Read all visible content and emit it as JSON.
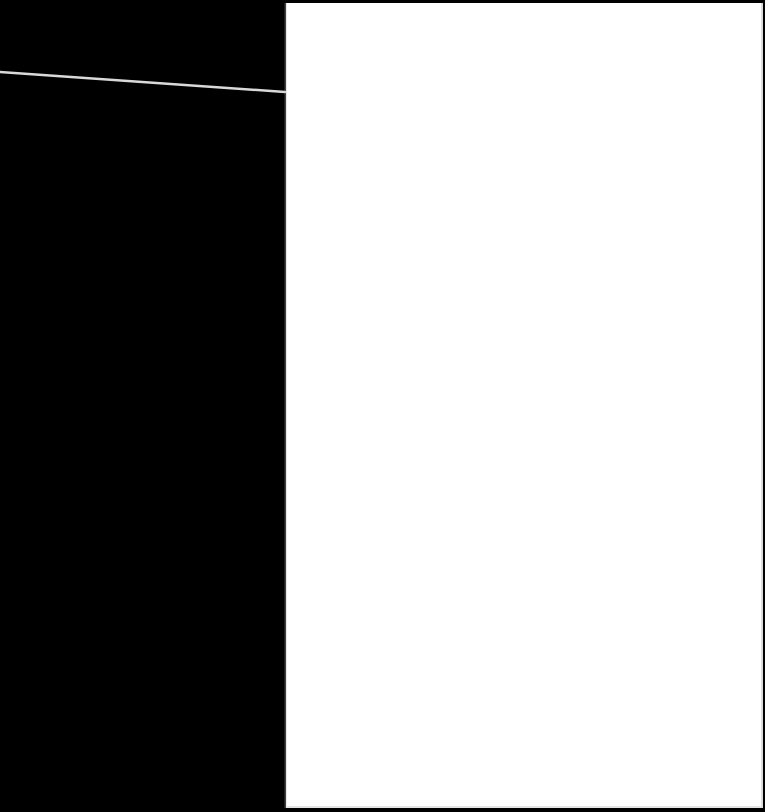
{
  "scene": {
    "description": "Blank white sheet of paper photographed against a black background with a thin light line crossing the dark area",
    "background_color": "#000000",
    "paper_color": "#ffffff",
    "wire_color": "#d9d9d9",
    "text_content": []
  }
}
